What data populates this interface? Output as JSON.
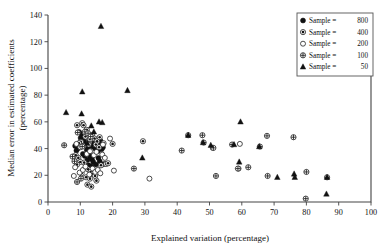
{
  "chart_data": {
    "type": "scatter",
    "title": "",
    "xlabel": "Explained variation (percentage)",
    "ylabel": "Median error in estimated coefficients (percentage)",
    "ylabel_line1": "Median error in estimated coefficients",
    "ylabel_line2": "(percentage)",
    "xlim": [
      0,
      100
    ],
    "ylim": [
      0,
      140
    ],
    "xticks": [
      0,
      10,
      20,
      30,
      40,
      50,
      60,
      70,
      80,
      90,
      100
    ],
    "yticks": [
      0,
      20,
      40,
      60,
      80,
      100,
      120,
      140
    ],
    "xtick_labels": [
      "0",
      "10",
      "20",
      "30",
      "40",
      "50",
      "60",
      "70",
      "80",
      "90",
      "100"
    ],
    "ytick_labels": [
      "0",
      "20",
      "40",
      "60",
      "80",
      "100",
      "120",
      "140"
    ],
    "grid": false,
    "legend_position": "top-right",
    "legend_title": "",
    "series": [
      {
        "name": "Sample =  800",
        "label_prefix": "Sample =",
        "label_value": "800",
        "marker": "filled-circle",
        "color": "#111111",
        "points": [
          [
            9.6,
            52.5
          ],
          [
            10.4,
            51.0
          ],
          [
            10.1,
            48.0
          ],
          [
            11.2,
            46.0
          ],
          [
            11.8,
            43.5
          ],
          [
            12.4,
            41.0
          ],
          [
            12.0,
            39.0
          ],
          [
            12.8,
            37.5
          ],
          [
            13.3,
            43.0
          ],
          [
            13.8,
            41.5
          ],
          [
            14.2,
            44.0
          ],
          [
            14.6,
            40.0
          ],
          [
            15.0,
            42.5
          ],
          [
            15.4,
            38.0
          ],
          [
            15.8,
            44.5
          ],
          [
            16.2,
            46.0
          ],
          [
            16.6,
            39.5
          ],
          [
            17.0,
            41.0
          ],
          [
            13.0,
            34.0
          ],
          [
            13.6,
            32.0
          ],
          [
            14.0,
            30.0
          ],
          [
            12.2,
            31.5
          ],
          [
            11.4,
            34.5
          ],
          [
            10.8,
            36.0
          ],
          [
            15.6,
            33.0
          ],
          [
            16.0,
            30.5
          ],
          [
            16.8,
            28.0
          ],
          [
            9.2,
            40.0
          ],
          [
            8.8,
            38.5
          ],
          [
            8.4,
            42.0
          ],
          [
            17.4,
            28.5
          ],
          [
            14.8,
            28.0
          ],
          [
            13.4,
            26.5
          ],
          [
            12.6,
            27.5
          ]
        ]
      },
      {
        "name": "Sample =  400",
        "label_prefix": "Sample =",
        "label_value": "400",
        "marker": "dotted-circle",
        "color": "#111111",
        "points": [
          [
            10.6,
            59.0
          ],
          [
            11.0,
            57.5
          ],
          [
            12.0,
            54.0
          ],
          [
            9.0,
            57.5
          ],
          [
            13.6,
            50.0
          ],
          [
            14.4,
            47.5
          ],
          [
            15.2,
            45.5
          ],
          [
            16.0,
            48.5
          ],
          [
            11.6,
            49.0
          ],
          [
            10.2,
            45.0
          ],
          [
            9.6,
            44.0
          ],
          [
            12.8,
            45.0
          ],
          [
            13.0,
            47.0
          ],
          [
            14.8,
            43.0
          ],
          [
            15.8,
            41.0
          ],
          [
            17.2,
            44.0
          ],
          [
            8.6,
            35.0
          ],
          [
            9.4,
            33.0
          ],
          [
            10.0,
            30.0
          ],
          [
            11.2,
            29.5
          ],
          [
            12.4,
            24.5
          ],
          [
            13.2,
            22.5
          ],
          [
            14.0,
            21.0
          ],
          [
            10.4,
            21.5
          ],
          [
            11.8,
            18.5
          ],
          [
            13.0,
            17.5
          ],
          [
            14.6,
            19.5
          ],
          [
            16.4,
            27.5
          ],
          [
            18.0,
            28.5
          ],
          [
            20.0,
            43.5
          ],
          [
            18.6,
            29.0
          ],
          [
            29.4,
            45.5
          ],
          [
            12.2,
            13.0
          ],
          [
            13.4,
            11.5
          ],
          [
            15.0,
            16.0
          ],
          [
            9.0,
            28.0
          ]
        ]
      },
      {
        "name": "Sample =  200",
        "label_prefix": "Sample =",
        "label_value": "200",
        "marker": "open-circle",
        "color": "#222222",
        "points": [
          [
            8.4,
            26.0
          ],
          [
            8.0,
            19.5
          ],
          [
            9.8,
            22.0
          ],
          [
            10.8,
            24.0
          ],
          [
            11.6,
            26.5
          ],
          [
            12.8,
            20.5
          ],
          [
            13.8,
            25.0
          ],
          [
            14.6,
            22.5
          ],
          [
            15.4,
            24.0
          ],
          [
            16.2,
            21.5
          ],
          [
            12.0,
            36.0
          ],
          [
            13.0,
            38.0
          ],
          [
            14.2,
            35.0
          ],
          [
            15.0,
            37.5
          ],
          [
            16.8,
            35.5
          ],
          [
            17.6,
            33.0
          ],
          [
            19.2,
            47.5
          ],
          [
            20.4,
            23.5
          ],
          [
            17.0,
            43.0
          ],
          [
            31.4,
            17.5
          ],
          [
            51.0,
            40.5
          ],
          [
            59.4,
            43.5
          ],
          [
            59.0,
            25.0
          ],
          [
            8.8,
            43.5
          ],
          [
            10.0,
            41.0
          ],
          [
            11.0,
            42.0
          ],
          [
            12.6,
            43.0
          ]
        ]
      },
      {
        "name": "Sample =  100",
        "label_prefix": "Sample =",
        "label_value": "100",
        "marker": "hatched-circle",
        "color": "#555555",
        "points": [
          [
            5.0,
            42.5
          ],
          [
            7.6,
            34.0
          ],
          [
            8.2,
            30.5
          ],
          [
            9.2,
            52.0
          ],
          [
            10.6,
            41.5
          ],
          [
            11.4,
            52.5
          ],
          [
            12.4,
            51.5
          ],
          [
            13.2,
            49.0
          ],
          [
            26.6,
            25.0
          ],
          [
            41.4,
            38.5
          ],
          [
            43.4,
            50.0
          ],
          [
            47.8,
            50.0
          ],
          [
            48.2,
            44.5
          ],
          [
            51.2,
            40.5
          ],
          [
            52.0,
            19.5
          ],
          [
            57.0,
            43.0
          ],
          [
            58.8,
            25.0
          ],
          [
            62.0,
            26.0
          ],
          [
            65.6,
            41.5
          ],
          [
            67.8,
            49.5
          ],
          [
            68.0,
            19.5
          ],
          [
            76.0,
            48.5
          ],
          [
            80.0,
            22.5
          ],
          [
            79.8,
            2.5
          ],
          [
            86.4,
            18.5
          ],
          [
            10.2,
            17.5
          ],
          [
            9.0,
            15.0
          ]
        ]
      },
      {
        "name": "Sample =   50",
        "label_prefix": "Sample =",
        "label_value": "50",
        "marker": "filled-triangle",
        "color": "#111111",
        "points": [
          [
            16.4,
            131.5
          ],
          [
            10.6,
            82.5
          ],
          [
            24.6,
            83.5
          ],
          [
            5.6,
            67.0
          ],
          [
            10.4,
            66.0
          ],
          [
            13.4,
            57.0
          ],
          [
            16.8,
            59.5
          ],
          [
            15.8,
            60.0
          ],
          [
            14.2,
            52.5
          ],
          [
            12.2,
            44.0
          ],
          [
            29.2,
            33.0
          ],
          [
            43.4,
            50.0
          ],
          [
            48.0,
            44.5
          ],
          [
            50.4,
            42.5
          ],
          [
            59.6,
            60.0
          ],
          [
            59.2,
            30.0
          ],
          [
            65.4,
            41.5
          ],
          [
            71.0,
            18.5
          ],
          [
            76.2,
            21.0
          ],
          [
            76.4,
            18.5
          ],
          [
            86.4,
            18.5
          ],
          [
            86.2,
            6.0
          ],
          [
            57.6,
            43.0
          ]
        ]
      }
    ]
  },
  "legend": {
    "items": [
      {
        "label": "Sample =",
        "value": "800",
        "marker": "filled-circle"
      },
      {
        "label": "Sample =",
        "value": "400",
        "marker": "dotted-circle"
      },
      {
        "label": "Sample =",
        "value": "200",
        "marker": "open-circle"
      },
      {
        "label": "Sample =",
        "value": "100",
        "marker": "hatched-circle"
      },
      {
        "label": "Sample =",
        "value": "50",
        "marker": "filled-triangle"
      }
    ]
  },
  "colors": {
    "axis": "#444444",
    "text": "#111111",
    "marker_fill": "#111111",
    "marker_open": "#ffffff",
    "legend_border": "#555555",
    "background": "#ffffff"
  }
}
